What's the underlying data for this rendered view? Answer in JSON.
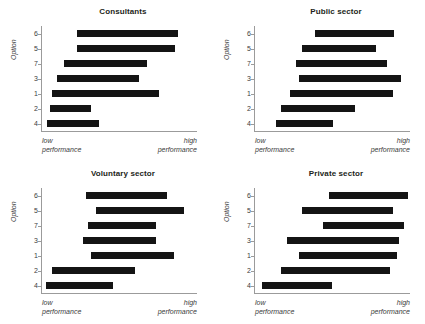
{
  "figure": {
    "axis_label_y": "Option",
    "x_caption_low": "low\nperformance",
    "x_caption_low_line1": "low",
    "x_caption_low_line2": "performance",
    "x_caption_high_line1": "high",
    "x_caption_high_line2": "performance",
    "bar_color": "#141414",
    "axis_color": "#9b9b9b"
  },
  "chart_data": [
    {
      "type": "bar",
      "orientation": "horizontal-range",
      "title": "Consultants",
      "xlabel": "",
      "ylabel": "Option",
      "xtick_labels": [
        "low performance",
        "high performance"
      ],
      "xlim": [
        0,
        100
      ],
      "grid": false,
      "legend": "none",
      "categories": [
        "6",
        "5",
        "7",
        "3",
        "1",
        "2",
        "4"
      ],
      "bars": [
        {
          "option": "6",
          "start": 23,
          "end": 88
        },
        {
          "option": "5",
          "start": 23,
          "end": 86
        },
        {
          "option": "7",
          "start": 15,
          "end": 68
        },
        {
          "option": "3",
          "start": 10,
          "end": 63
        },
        {
          "option": "1",
          "start": 7,
          "end": 76
        },
        {
          "option": "2",
          "start": 6,
          "end": 32
        },
        {
          "option": "4",
          "start": 4,
          "end": 37
        }
      ]
    },
    {
      "type": "bar",
      "orientation": "horizontal-range",
      "title": "Public sector",
      "xlabel": "",
      "ylabel": "Option",
      "xtick_labels": [
        "low performance",
        "high performance"
      ],
      "xlim": [
        0,
        100
      ],
      "grid": false,
      "legend": "none",
      "categories": [
        "6",
        "5",
        "7",
        "3",
        "1",
        "2",
        "4"
      ],
      "bars": [
        {
          "option": "6",
          "start": 39,
          "end": 90
        },
        {
          "option": "5",
          "start": 31,
          "end": 78
        },
        {
          "option": "7",
          "start": 27,
          "end": 85
        },
        {
          "option": "3",
          "start": 29,
          "end": 94
        },
        {
          "option": "1",
          "start": 23,
          "end": 89
        },
        {
          "option": "2",
          "start": 17,
          "end": 65
        },
        {
          "option": "4",
          "start": 14,
          "end": 51
        }
      ]
    },
    {
      "type": "bar",
      "orientation": "horizontal-range",
      "title": "Voluntary sector",
      "xlabel": "",
      "ylabel": "Option",
      "xtick_labels": [
        "low performance",
        "high performance"
      ],
      "xlim": [
        0,
        100
      ],
      "grid": false,
      "legend": "none",
      "categories": [
        "6",
        "5",
        "7",
        "3",
        "1",
        "2",
        "4"
      ],
      "bars": [
        {
          "option": "6",
          "start": 29,
          "end": 81
        },
        {
          "option": "5",
          "start": 35,
          "end": 92
        },
        {
          "option": "7",
          "start": 30,
          "end": 74
        },
        {
          "option": "3",
          "start": 27,
          "end": 74
        },
        {
          "option": "1",
          "start": 32,
          "end": 85
        },
        {
          "option": "2",
          "start": 7,
          "end": 60
        },
        {
          "option": "4",
          "start": 3,
          "end": 46
        }
      ]
    },
    {
      "type": "bar",
      "orientation": "horizontal-range",
      "title": "Private sector",
      "xlabel": "",
      "ylabel": "Option",
      "xtick_labels": [
        "low performance",
        "high performance"
      ],
      "xlim": [
        0,
        100
      ],
      "grid": false,
      "legend": "none",
      "categories": [
        "6",
        "5",
        "7",
        "3",
        "1",
        "2",
        "4"
      ],
      "bars": [
        {
          "option": "6",
          "start": 48,
          "end": 99
        },
        {
          "option": "5",
          "start": 31,
          "end": 89
        },
        {
          "option": "7",
          "start": 44,
          "end": 96
        },
        {
          "option": "3",
          "start": 21,
          "end": 93
        },
        {
          "option": "1",
          "start": 29,
          "end": 92
        },
        {
          "option": "2",
          "start": 17,
          "end": 87
        },
        {
          "option": "4",
          "start": 5,
          "end": 50
        }
      ]
    }
  ]
}
